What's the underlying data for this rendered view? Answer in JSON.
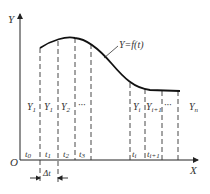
{
  "diagram": {
    "axes": {
      "y_label": "Y",
      "x_label": "X",
      "origin_label": "O"
    },
    "curve_label": "Y=f(t)",
    "interval_labels": [
      "Y",
      "Y",
      "Y",
      "···",
      "Y",
      "Y",
      "···",
      "Y"
    ],
    "interval_subs": [
      "1",
      "1",
      "2",
      "",
      "i",
      "i+1",
      "",
      "n"
    ],
    "tick_labels": [
      "t",
      "t",
      "t",
      "t",
      "t",
      "t"
    ],
    "tick_subs": [
      "0",
      "1",
      "2",
      "3",
      "i",
      "i+1"
    ],
    "delta_label": "Δt",
    "colors": {
      "line": "#222222",
      "text": "#333333"
    }
  }
}
